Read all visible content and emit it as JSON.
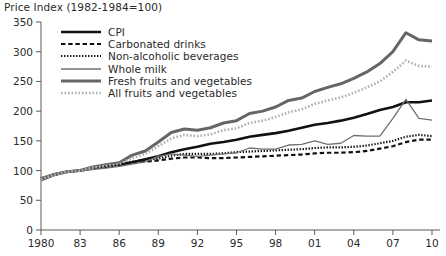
{
  "chart_data": {
    "type": "line",
    "title": "Price Index (1982-1984=100)",
    "xlabel": "",
    "ylabel": "",
    "xlim": [
      1980,
      2010
    ],
    "ylim": [
      0,
      350
    ],
    "yticks": [
      0,
      50,
      100,
      150,
      200,
      250,
      300,
      350
    ],
    "xticks": [
      1980,
      1983,
      1986,
      1989,
      1992,
      1995,
      1998,
      2001,
      2004,
      2007,
      2010
    ],
    "xticklabels": [
      "1980",
      "83",
      "86",
      "89",
      "92",
      "95",
      "98",
      "01",
      "04",
      "07",
      "10"
    ],
    "grid": false,
    "legend_position": "upper left",
    "x": [
      1980,
      1981,
      1982,
      1983,
      1984,
      1985,
      1986,
      1987,
      1988,
      1989,
      1990,
      1991,
      1992,
      1993,
      1994,
      1995,
      1996,
      1997,
      1998,
      1999,
      2000,
      2001,
      2002,
      2003,
      2004,
      2005,
      2006,
      2007,
      2008,
      2009,
      2010
    ],
    "series": [
      {
        "name": "CPI",
        "color": "#111111",
        "style": "solid",
        "width": 2.6,
        "values": [
          85,
          93,
          98,
          100,
          104,
          108,
          110,
          114,
          119,
          124,
          131,
          136,
          140,
          145,
          148,
          152,
          157,
          160,
          163,
          167,
          172,
          177,
          180,
          184,
          189,
          195,
          202,
          207,
          215,
          215,
          218
        ]
      },
      {
        "name": "Carbonated drinks",
        "color": "#111111",
        "style": "dashed",
        "width": 2.2,
        "values": [
          86,
          93,
          98,
          100,
          103,
          106,
          110,
          113,
          115,
          117,
          120,
          122,
          122,
          121,
          121,
          122,
          123,
          124,
          125,
          126,
          127,
          129,
          130,
          130,
          131,
          133,
          137,
          141,
          148,
          152,
          152
        ]
      },
      {
        "name": "Non-alcoholic beverages",
        "color": "#111111",
        "style": "dotted",
        "width": 2.2,
        "values": [
          87,
          94,
          98,
          100,
          104,
          107,
          111,
          115,
          118,
          120,
          125,
          128,
          128,
          128,
          129,
          131,
          132,
          133,
          134,
          135,
          136,
          138,
          139,
          139,
          140,
          142,
          146,
          150,
          157,
          160,
          158
        ]
      },
      {
        "name": "Whole milk",
        "color": "#707070",
        "style": "solid",
        "width": 1.3,
        "values": [
          88,
          95,
          99,
          100,
          102,
          104,
          107,
          111,
          115,
          124,
          128,
          126,
          124,
          126,
          128,
          130,
          138,
          136,
          136,
          143,
          144,
          150,
          144,
          146,
          159,
          158,
          158,
          188,
          220,
          188,
          185
        ]
      },
      {
        "name": "Fresh fruits and vegetables",
        "color": "#666666",
        "style": "solid",
        "width": 3.0,
        "values": [
          84,
          93,
          98,
          100,
          106,
          110,
          113,
          126,
          133,
          148,
          164,
          170,
          168,
          172,
          180,
          184,
          196,
          200,
          207,
          218,
          222,
          233,
          240,
          246,
          255,
          266,
          280,
          300,
          332,
          320,
          318
        ]
      },
      {
        "name": "All fruits and vegetables",
        "color": "#b0b0b0",
        "style": "dotted",
        "width": 2.6,
        "values": [
          85,
          93,
          98,
          100,
          105,
          108,
          111,
          121,
          128,
          141,
          154,
          160,
          158,
          161,
          168,
          171,
          180,
          184,
          190,
          198,
          203,
          212,
          218,
          223,
          231,
          240,
          250,
          266,
          285,
          276,
          275
        ]
      }
    ]
  }
}
